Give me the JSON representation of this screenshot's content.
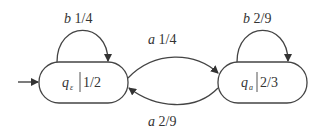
{
  "diagram": {
    "type": "probabilistic-automaton",
    "states": [
      {
        "id": "q_eps",
        "name": "q",
        "subscript": "ε",
        "prob": "1/2",
        "initial": true
      },
      {
        "id": "q_a",
        "name": "q",
        "subscript": "a",
        "prob": "2/3",
        "initial": false
      }
    ],
    "transitions": [
      {
        "from": "q_eps",
        "to": "q_eps",
        "symbol": "b",
        "prob": "1/4"
      },
      {
        "from": "q_eps",
        "to": "q_a",
        "symbol": "a",
        "prob": "1/4"
      },
      {
        "from": "q_a",
        "to": "q_eps",
        "symbol": "a",
        "prob": "2/9"
      },
      {
        "from": "q_a",
        "to": "q_a",
        "symbol": "b",
        "prob": "2/9"
      }
    ],
    "colors": {
      "stroke": "#444444",
      "text": "#333333",
      "background": "#ffffff"
    }
  }
}
